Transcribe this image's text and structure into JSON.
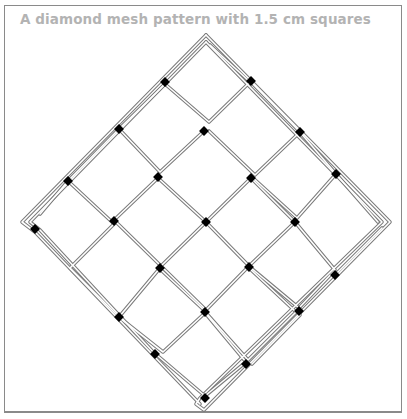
{
  "title": "A diamond mesh pattern with 1.5 cm squares",
  "figure": {
    "mesh_square_size": "1.5 cm",
    "rows_of_meshes": 4,
    "cols_of_meshes": 4,
    "strand_color": "#7a7a7a",
    "knot_color": "#000000",
    "frame_color": "#8a8a8a",
    "title_color": "#b3b3b3"
  }
}
